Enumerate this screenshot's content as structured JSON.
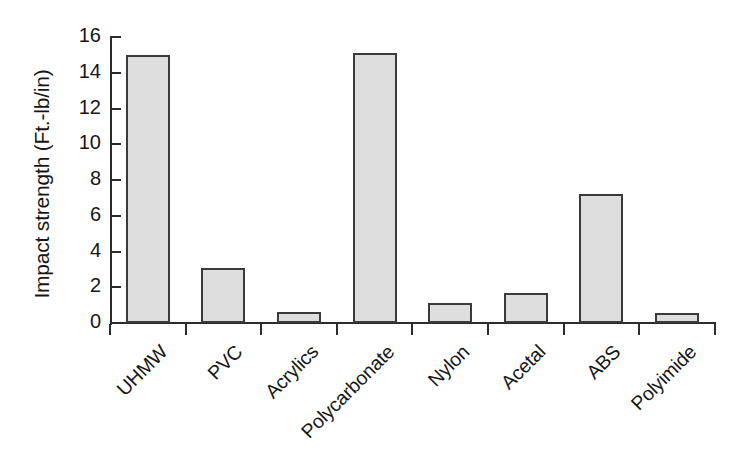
{
  "chart_data": {
    "type": "bar",
    "title": "",
    "xlabel": "",
    "ylabel": "Impact strength (Ft.-lb/in)",
    "ylim": [
      0,
      16
    ],
    "yticks": [
      0,
      2,
      4,
      6,
      8,
      10,
      12,
      14,
      16
    ],
    "ytick_labels": [
      "0",
      "2",
      "4",
      "6",
      "8",
      "10",
      "12",
      "14",
      "16"
    ],
    "grid": false,
    "legend": null,
    "categories": [
      "UHMW",
      "PVC",
      "Acrylics",
      "Polycarbonate",
      "Nylon",
      "Acetal",
      "ABS",
      "Polyimide"
    ],
    "values": [
      15.0,
      3.1,
      0.6,
      15.1,
      1.1,
      1.7,
      7.2,
      0.55
    ],
    "bar_fill_color": "#dedede",
    "bar_edge_color": "#3a3a3a",
    "background_color": "#ffffff"
  }
}
